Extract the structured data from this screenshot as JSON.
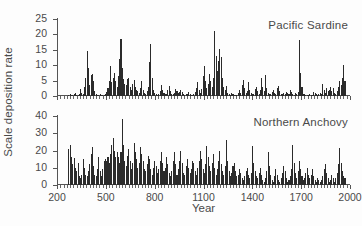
{
  "chart_data": [
    {
      "type": "bar",
      "title": "Pacific Sardine",
      "xlabel": "Year",
      "ylabel": "Scale deposition rate",
      "xlim": [
        200,
        2000
      ],
      "ylim": [
        0,
        25
      ],
      "yticks": [
        0,
        5,
        10,
        15,
        20,
        25
      ],
      "xticks": [
        200,
        500,
        800,
        1100,
        1400,
        1700,
        2000
      ],
      "grid": false,
      "legend": "none",
      "bar_color": "#2b2b2b",
      "x": [
        270,
        278,
        286,
        294,
        302,
        310,
        318,
        326,
        334,
        342,
        350,
        358,
        366,
        374,
        382,
        390,
        398,
        406,
        414,
        422,
        430,
        438,
        446,
        454,
        462,
        470,
        478,
        486,
        494,
        502,
        510,
        518,
        526,
        534,
        542,
        550,
        558,
        566,
        574,
        582,
        590,
        598,
        606,
        614,
        622,
        630,
        638,
        646,
        654,
        662,
        670,
        678,
        686,
        694,
        702,
        710,
        718,
        726,
        734,
        742,
        750,
        758,
        766,
        774,
        782,
        790,
        798,
        806,
        814,
        822,
        830,
        838,
        846,
        854,
        862,
        870,
        878,
        886,
        894,
        902,
        910,
        918,
        926,
        934,
        942,
        950,
        958,
        966,
        974,
        982,
        990,
        998,
        1006,
        1014,
        1022,
        1030,
        1038,
        1046,
        1054,
        1062,
        1070,
        1078,
        1086,
        1094,
        1102,
        1110,
        1118,
        1126,
        1134,
        1142,
        1150,
        1158,
        1166,
        1174,
        1182,
        1190,
        1198,
        1206,
        1214,
        1222,
        1230,
        1238,
        1246,
        1254,
        1262,
        1270,
        1278,
        1286,
        1294,
        1302,
        1310,
        1318,
        1326,
        1334,
        1342,
        1350,
        1358,
        1366,
        1374,
        1382,
        1390,
        1398,
        1406,
        1414,
        1422,
        1430,
        1438,
        1446,
        1454,
        1462,
        1470,
        1478,
        1486,
        1494,
        1502,
        1510,
        1518,
        1526,
        1534,
        1542,
        1550,
        1558,
        1566,
        1574,
        1582,
        1590,
        1598,
        1606,
        1614,
        1622,
        1630,
        1638,
        1646,
        1654,
        1662,
        1670,
        1678,
        1686,
        1694,
        1702,
        1710,
        1718,
        1726,
        1734,
        1742,
        1750,
        1758,
        1766,
        1774,
        1782,
        1790,
        1798,
        1806,
        1814,
        1822,
        1830,
        1838,
        1846,
        1854,
        1862,
        1870,
        1878,
        1886,
        1894,
        1902,
        1910,
        1918,
        1926,
        1934,
        1942,
        1950,
        1958,
        1966
      ],
      "values": [
        0.4,
        0.6,
        0.3,
        0.2,
        0.5,
        1.0,
        0.4,
        0.3,
        0.8,
        2.2,
        1.0,
        0.6,
        3.0,
        6.0,
        14.6,
        9.0,
        3.5,
        6.8,
        7.2,
        5.0,
        1.5,
        0.8,
        0.4,
        0.3,
        0.5,
        0.4,
        0.2,
        0.3,
        0.6,
        1.2,
        2.5,
        5.0,
        9.6,
        4.5,
        6.0,
        7.5,
        5.0,
        3.0,
        6.5,
        12.0,
        18.6,
        9.0,
        5.5,
        4.0,
        3.5,
        5.5,
        6.0,
        3.0,
        2.0,
        4.0,
        5.3,
        3.0,
        2.0,
        1.5,
        1.0,
        2.5,
        5.0,
        2.0,
        1.0,
        0.8,
        1.5,
        3.0,
        11.0,
        16.8,
        6.0,
        2.0,
        1.0,
        0.6,
        0.4,
        0.5,
        1.5,
        3.5,
        2.0,
        1.0,
        0.6,
        0.8,
        1.8,
        3.4,
        1.6,
        0.7,
        0.5,
        1.0,
        2.3,
        1.7,
        0.9,
        1.2,
        2.0,
        1.3,
        0.6,
        0.4,
        0.5,
        0.8,
        1.3,
        0.7,
        0.4,
        0.3,
        0.5,
        1.2,
        2.6,
        4.5,
        2.0,
        1.0,
        2.2,
        6.5,
        9.6,
        5.0,
        2.5,
        4.0,
        7.0,
        5.0,
        3.0,
        6.0,
        21.2,
        13.0,
        8.0,
        11.5,
        15.4,
        12.6,
        6.0,
        3.0,
        2.0,
        3.4,
        1.0,
        0.5,
        0.4,
        1.0,
        0.6,
        0.3,
        0.2,
        0.4,
        1.0,
        2.0,
        1.0,
        3.5,
        5.2,
        2.5,
        1.0,
        1.5,
        4.6,
        2.0,
        1.0,
        0.5,
        0.8,
        2.2,
        3.0,
        1.5,
        0.8,
        2.0,
        6.0,
        3.0,
        1.5,
        6.7,
        2.5,
        1.0,
        0.7,
        0.5,
        1.2,
        2.0,
        1.0,
        0.6,
        2.6,
        3.2,
        1.5,
        0.8,
        0.5,
        1.0,
        0.6,
        1.4,
        1.0,
        0.6,
        1.8,
        1.2,
        0.6,
        0.4,
        1.0,
        0.7,
        1.4,
        18.3,
        7.5,
        3.0,
        0.8,
        0.5,
        0.3,
        0.2,
        0.3,
        0.5,
        0.3,
        0.2,
        1.4,
        1.0,
        0.5,
        0.3,
        0.6,
        1.0,
        0.5,
        4.0,
        2.0,
        1.0,
        2.5,
        1.5,
        2.0,
        3.0,
        1.5,
        2.5,
        1.0,
        0.8,
        1.5,
        3.0,
        5.0,
        3.5,
        6.0,
        10.1,
        5.0,
        3.0,
        4.5,
        2.0,
        10.1,
        5.5,
        2.5,
        6.5,
        3.0,
        1.2,
        0.5,
        0.3
      ]
    },
    {
      "type": "bar",
      "title": "Northern Anchovy",
      "xlabel": "Year",
      "ylabel": "Scale deposition rate",
      "xlim": [
        200,
        2000
      ],
      "ylim": [
        0,
        40
      ],
      "yticks": [
        0,
        10,
        20,
        30,
        40
      ],
      "xticks": [
        200,
        500,
        800,
        1100,
        1400,
        1700,
        2000
      ],
      "grid": false,
      "legend": "none",
      "bar_color": "#2b2b2b",
      "x": [
        270,
        278,
        286,
        294,
        302,
        310,
        318,
        326,
        334,
        342,
        350,
        358,
        366,
        374,
        382,
        390,
        398,
        406,
        414,
        422,
        430,
        438,
        446,
        454,
        462,
        470,
        478,
        486,
        494,
        502,
        510,
        518,
        526,
        534,
        542,
        550,
        558,
        566,
        574,
        582,
        590,
        598,
        606,
        614,
        622,
        630,
        638,
        646,
        654,
        662,
        670,
        678,
        686,
        694,
        702,
        710,
        718,
        726,
        734,
        742,
        750,
        758,
        766,
        774,
        782,
        790,
        798,
        806,
        814,
        822,
        830,
        838,
        846,
        854,
        862,
        870,
        878,
        886,
        894,
        902,
        910,
        918,
        926,
        934,
        942,
        950,
        958,
        966,
        974,
        982,
        990,
        998,
        1006,
        1014,
        1022,
        1030,
        1038,
        1046,
        1054,
        1062,
        1070,
        1078,
        1086,
        1094,
        1102,
        1110,
        1118,
        1126,
        1134,
        1142,
        1150,
        1158,
        1166,
        1174,
        1182,
        1190,
        1198,
        1206,
        1214,
        1222,
        1230,
        1238,
        1246,
        1254,
        1262,
        1270,
        1278,
        1286,
        1294,
        1302,
        1310,
        1318,
        1326,
        1334,
        1342,
        1350,
        1358,
        1366,
        1374,
        1382,
        1390,
        1398,
        1406,
        1414,
        1422,
        1430,
        1438,
        1446,
        1454,
        1462,
        1470,
        1478,
        1486,
        1494,
        1502,
        1510,
        1518,
        1526,
        1534,
        1542,
        1550,
        1558,
        1566,
        1574,
        1582,
        1590,
        1598,
        1606,
        1614,
        1622,
        1630,
        1638,
        1646,
        1654,
        1662,
        1670,
        1678,
        1686,
        1694,
        1702,
        1710,
        1718,
        1726,
        1734,
        1742,
        1750,
        1758,
        1766,
        1774,
        1782,
        1790,
        1798,
        1806,
        1814,
        1822,
        1830,
        1838,
        1846,
        1854,
        1862,
        1870,
        1878,
        1886,
        1894,
        1902,
        1910,
        1918,
        1926,
        1934,
        1942,
        1950,
        1958,
        1966
      ],
      "values": [
        21.0,
        23.3,
        16.0,
        12.0,
        15.5,
        10.0,
        8.0,
        13.0,
        5.0,
        4.0,
        6.0,
        15.0,
        10.0,
        6.0,
        5.0,
        8.0,
        12.0,
        18.0,
        22.0,
        11.0,
        6.0,
        5.0,
        9.0,
        16.0,
        8.0,
        5.0,
        9.0,
        14.0,
        15.0,
        14.0,
        16.0,
        13.0,
        18.0,
        23.0,
        27.0,
        20.0,
        16.0,
        19.0,
        16.0,
        13.0,
        19.0,
        38.0,
        23.0,
        14.0,
        11.0,
        17.0,
        21.0,
        14.0,
        9.0,
        13.0,
        24.5,
        19.0,
        15.0,
        10.0,
        13.0,
        22.0,
        18.0,
        14.0,
        9.0,
        8.0,
        12.0,
        17.0,
        15.0,
        9.0,
        6.0,
        10.0,
        14.0,
        11.0,
        7.0,
        9.0,
        14.0,
        19.0,
        13.0,
        8.0,
        10.0,
        16.0,
        12.0,
        7.0,
        5.0,
        8.0,
        14.0,
        19.0,
        12.0,
        6.0,
        9.0,
        14.0,
        20.0,
        13.0,
        7.0,
        6.0,
        11.0,
        15.0,
        10.0,
        7.0,
        9.0,
        14.0,
        13.0,
        8.0,
        6.0,
        10.0,
        14.0,
        20.0,
        15.0,
        9.0,
        7.0,
        12.0,
        22.5,
        16.0,
        11.0,
        8.0,
        13.0,
        18.0,
        10.0,
        6.0,
        9.0,
        14.0,
        20.0,
        12.0,
        8.0,
        6.0,
        11.0,
        26.0,
        14.0,
        8.0,
        5.0,
        7.0,
        11.0,
        13.0,
        8.0,
        5.0,
        6.0,
        9.0,
        7.0,
        4.0,
        3.0,
        5.0,
        8.0,
        10.0,
        6.0,
        4.0,
        7.0,
        22.4,
        13.0,
        8.0,
        5.0,
        4.0,
        7.0,
        10.0,
        6.0,
        3.0,
        2.0,
        4.0,
        8.0,
        19.0,
        11.0,
        6.0,
        3.0,
        2.0,
        5.0,
        9.0,
        6.0,
        3.0,
        2.0,
        4.0,
        7.0,
        11.0,
        8.0,
        4.0,
        2.0,
        3.0,
        5.0,
        9.0,
        23.0,
        13.0,
        7.0,
        4.0,
        8.0,
        14.0,
        9.0,
        5.0,
        3.0,
        4.0,
        7.0,
        10.0,
        6.0,
        4.0,
        6.0,
        9.0,
        5.0,
        3.0,
        2.0,
        4.0,
        3.0,
        2.0,
        3.0,
        5.0,
        9.0,
        12.0,
        7.0,
        4.0,
        2.0,
        3.0,
        6.0,
        4.0,
        2.0,
        4.0,
        7.0,
        12.0,
        21.5,
        13.0,
        8.0,
        5.0,
        4.0,
        7.0,
        10.0,
        8.0,
        6.0,
        9.0,
        11.0,
        8.0,
        12.0,
        14.0,
        10.0,
        13.0,
        17.8,
        16.5,
        12.0,
        8.0,
        5.0,
        3.0,
        1.5,
        1.0,
        2.0,
        5.0,
        8.0,
        3.0
      ]
    }
  ],
  "figure": {
    "ylabel": "Scale deposition rate",
    "xlabel": "Year"
  }
}
